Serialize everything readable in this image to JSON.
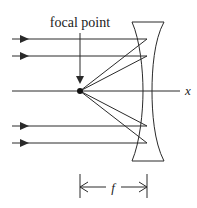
{
  "diagram": {
    "labels": {
      "focal_point": "focal point",
      "axis": "x",
      "focal_length": "f"
    },
    "colors": {
      "stroke": "#2a2a2a",
      "background": "#ffffff"
    },
    "incoming_rays_count": 4,
    "components": [
      "incoming parallel rays",
      "optical axis",
      "focal point",
      "concave lens",
      "focal length dimension"
    ]
  }
}
